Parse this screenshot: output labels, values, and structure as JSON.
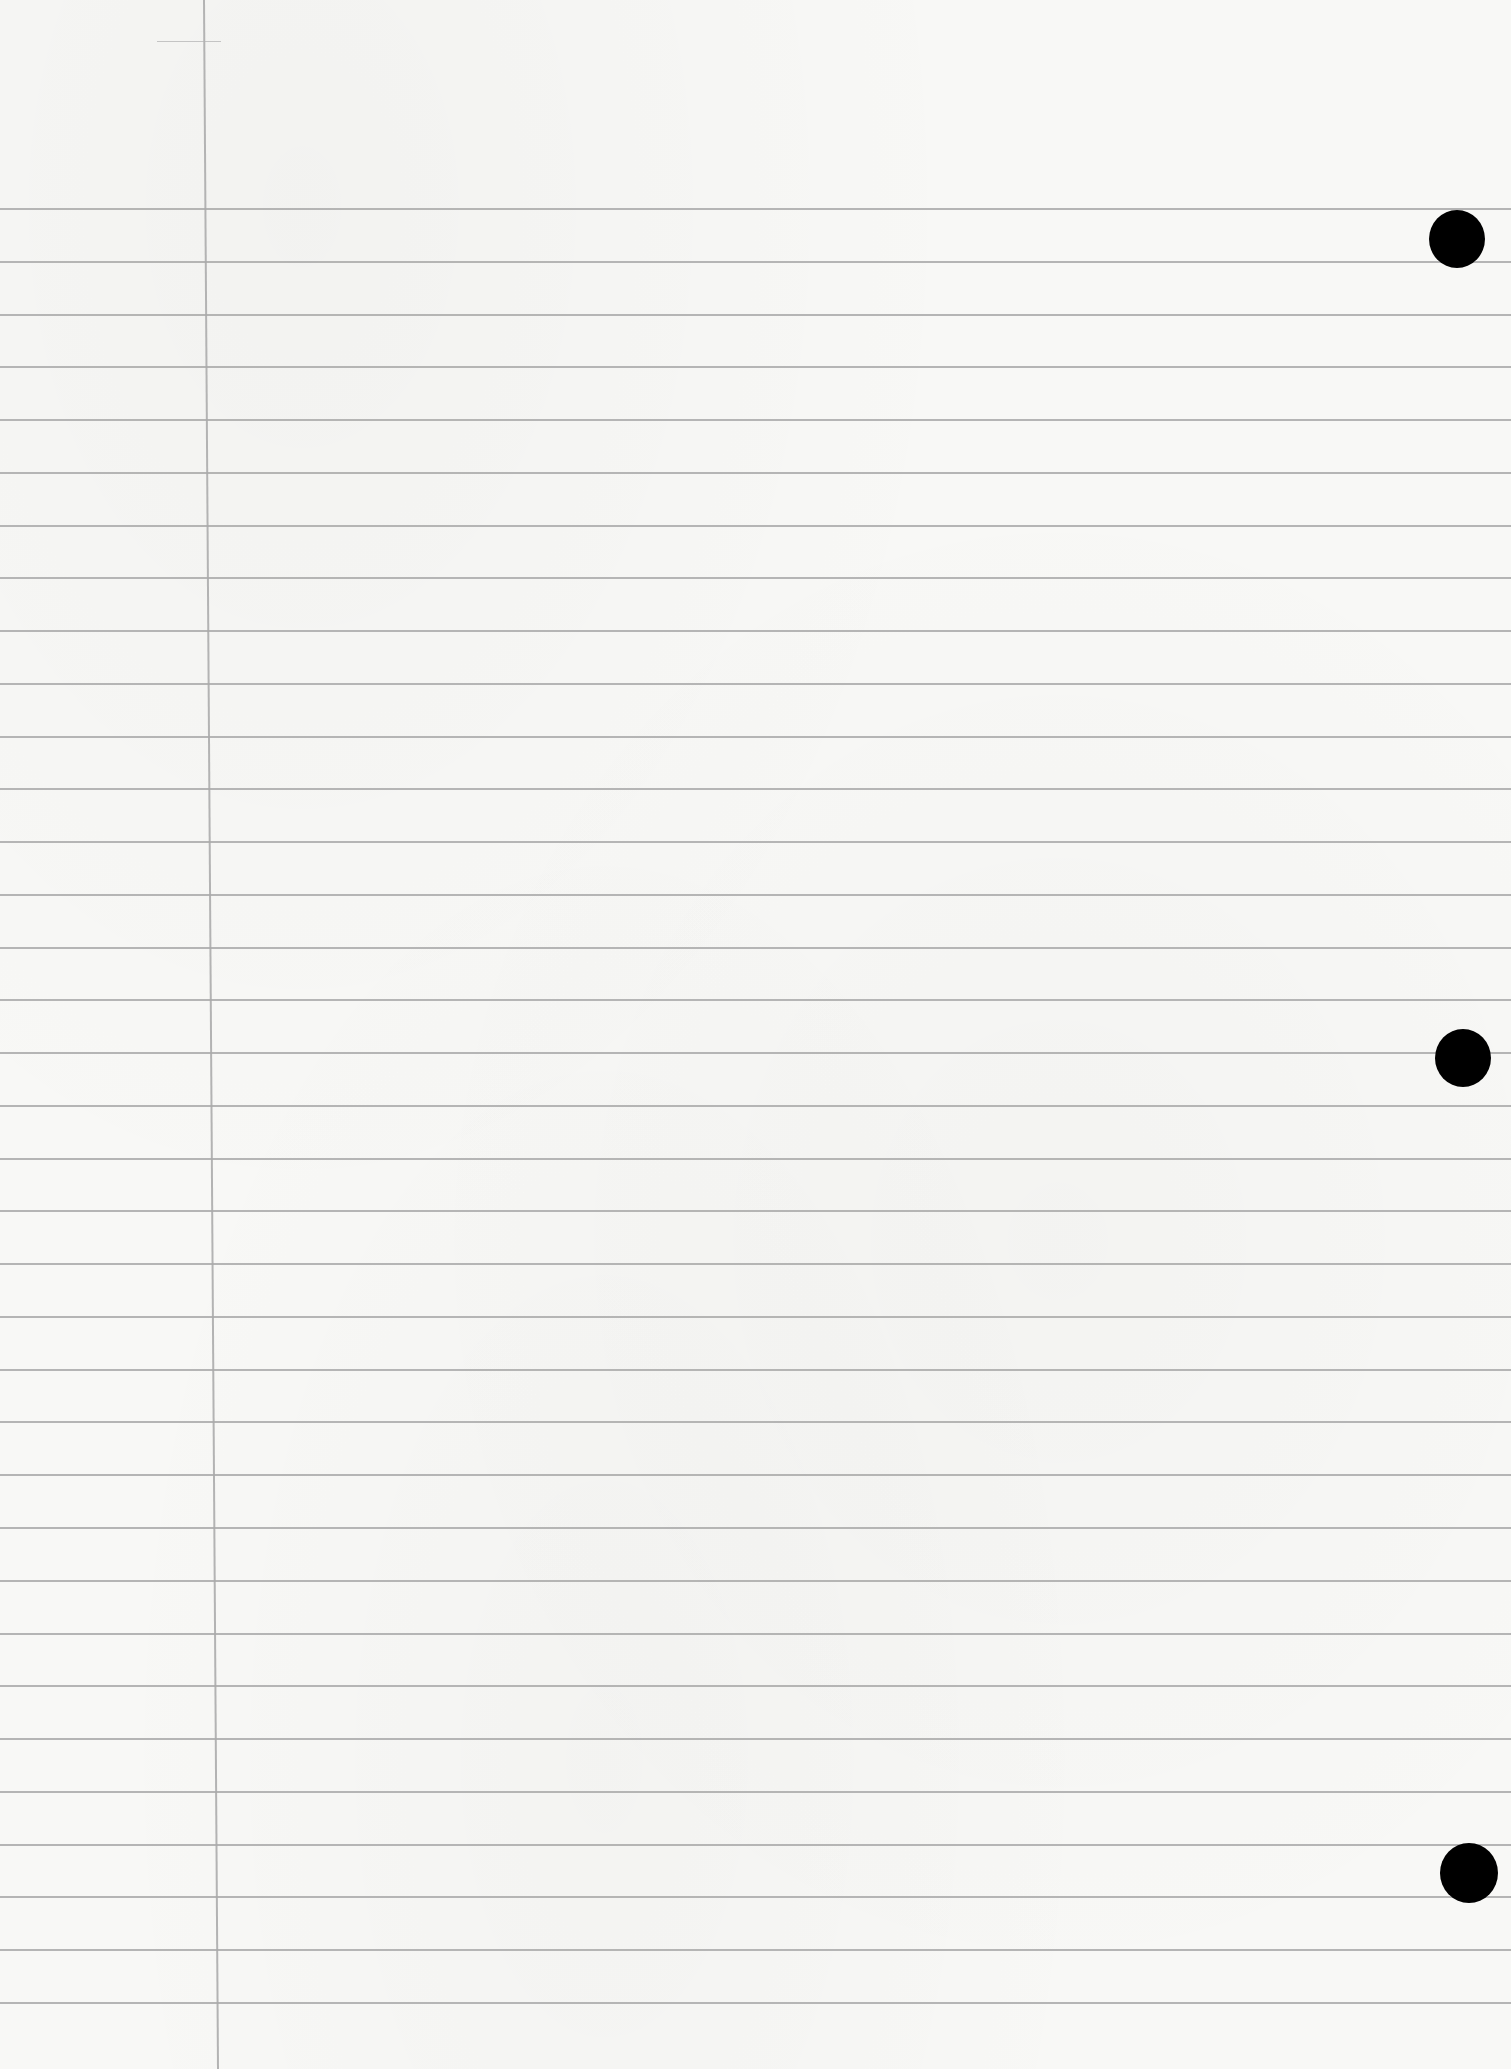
{
  "page": {
    "type": "lined-notebook-paper",
    "background_color": "#f8f8f6",
    "rule_color": "#a9a9a9",
    "margin_line_color": "#b3b3b3",
    "hole_color": "#000000"
  },
  "rules": {
    "count": 35,
    "first_y": 208,
    "spacing": 52.76
  },
  "margin_line": {
    "x_top": 203,
    "x_bottom": 217
  },
  "holes": [
    {
      "cx": 1457,
      "cy": 238,
      "r": 28
    },
    {
      "cx": 1463,
      "cy": 1057,
      "r": 28
    },
    {
      "cx": 1469,
      "cy": 1872,
      "r": 29
    }
  ]
}
